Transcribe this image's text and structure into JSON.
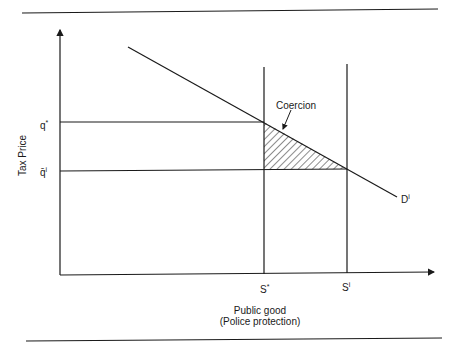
{
  "diagram": {
    "y_axis_label": "Tax Price",
    "x_axis_label_line1": "Public good",
    "x_axis_label_line2": "(Police protection)",
    "price_ticks": [
      {
        "label": "q",
        "sup": "*"
      },
      {
        "label": "q̄",
        "sup": "i"
      }
    ],
    "quantity_ticks": [
      {
        "label": "S",
        "sup": "*"
      },
      {
        "label": "S",
        "sup": "i"
      }
    ],
    "demand_label": "D",
    "demand_sup": "i",
    "annotation": "Coercion",
    "colors": {
      "line": "#1a1a1a",
      "background": "#ffffff"
    }
  }
}
